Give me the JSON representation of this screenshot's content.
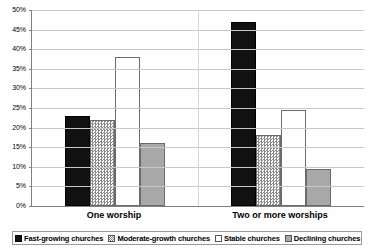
{
  "chart_data": {
    "type": "bar",
    "title": "",
    "xlabel": "",
    "ylabel": "",
    "ylim": [
      0,
      50
    ],
    "ytick_labels": [
      "50%",
      "45%",
      "40%",
      "35%",
      "30%",
      "25%",
      "20%",
      "15%",
      "10%",
      "5%",
      "0%"
    ],
    "ytick_values": [
      50,
      45,
      40,
      35,
      30,
      25,
      20,
      15,
      10,
      5,
      0
    ],
    "grid": true,
    "legend_position": "bottom",
    "categories": [
      "One worship",
      "Two or more worships"
    ],
    "series": [
      {
        "name": "Fast-growing churches",
        "values": [
          23,
          47
        ],
        "color": "#111111",
        "fill": "solid"
      },
      {
        "name": "Moderate-growth churches",
        "values": [
          22,
          18
        ],
        "color": "#d8d8d8",
        "fill": "checkered"
      },
      {
        "name": "Stable churches",
        "values": [
          38,
          24.5
        ],
        "color": "#ffffff",
        "fill": "empty"
      },
      {
        "name": "Declining churches",
        "values": [
          16,
          9.5
        ],
        "color": "#a8a8a8",
        "fill": "solid-gray"
      }
    ]
  },
  "legend": {
    "items": [
      {
        "label": "Fast-growing churches"
      },
      {
        "label": "Moderate-growth churches"
      },
      {
        "label": "Stable churches"
      },
      {
        "label": "Declining churches"
      }
    ]
  }
}
